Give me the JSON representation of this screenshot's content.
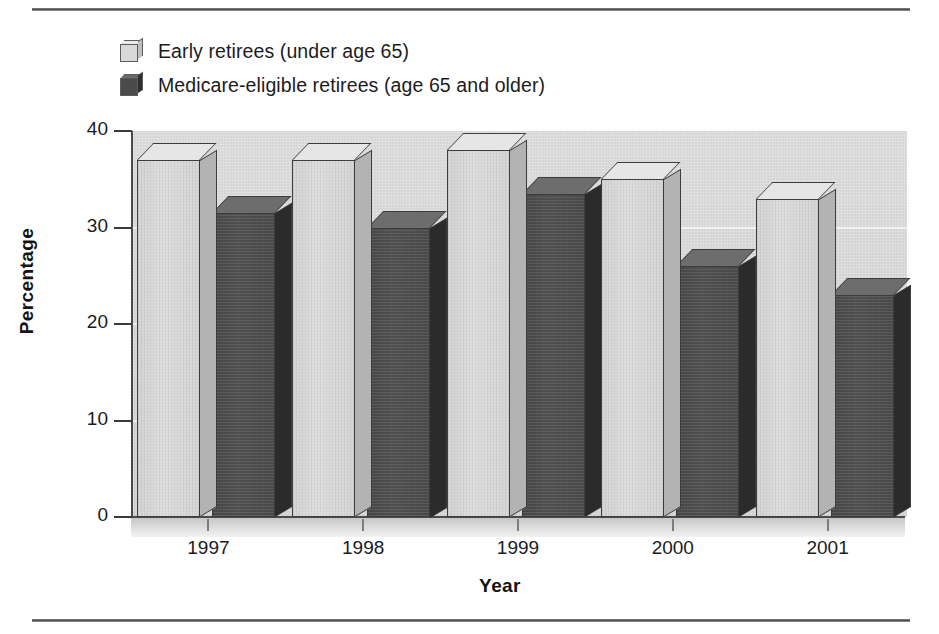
{
  "legend": {
    "items": [
      {
        "label": "Early retirees (under age 65)",
        "swatch": "light-3d-cube-icon",
        "color": "#d9d9d9"
      },
      {
        "label": "Medicare-eligible retirees (age 65 and older)",
        "swatch": "dark-3d-cube-icon",
        "color": "#4a4a4a"
      }
    ]
  },
  "chart_data": {
    "type": "bar",
    "title": "",
    "xlabel": "Year",
    "ylabel": "Percentage",
    "categories": [
      "1997",
      "1998",
      "1999",
      "2000",
      "2001"
    ],
    "series": [
      {
        "name": "Early retirees (under age 65)",
        "values": [
          37,
          37,
          38,
          35,
          33
        ],
        "color": "#d9d9d9"
      },
      {
        "name": "Medicare-eligible retirees (age 65 and older)",
        "values": [
          31.5,
          30,
          33.5,
          26,
          23
        ],
        "color": "#4a4a4a"
      }
    ],
    "ylim": [
      0,
      40
    ],
    "yticks": [
      0,
      10,
      20,
      30,
      40
    ],
    "ytick_labels": [
      "0",
      "10",
      "20",
      "30",
      "40"
    ],
    "grid": true,
    "legend_position": "top-left",
    "style": "3d-bars"
  }
}
